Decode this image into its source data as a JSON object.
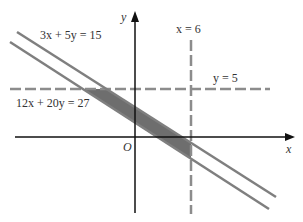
{
  "figure": {
    "colors": {
      "axis": "#111111",
      "line": "#7f7f7f",
      "dashed": "#8c8c8c",
      "shade": "#6e6e6e",
      "text": "#333333",
      "background": "#ffffff"
    },
    "axes": {
      "x_label": "x",
      "y_label": "y",
      "origin_label": "O"
    },
    "lines": [
      {
        "id": "upper",
        "label": "3x + 5y = 15",
        "style": "solid"
      },
      {
        "id": "lower",
        "label": "12x + 20y = 27",
        "style": "solid"
      },
      {
        "id": "vertical",
        "label": "x = 6",
        "style": "dashed"
      },
      {
        "id": "horizontal",
        "label": "y = 5",
        "style": "dashed"
      }
    ],
    "shaded_region": "feasible region between 12x + 20y = 27 and 3x + 5y = 15, bounded by y = 5 and x = 6"
  }
}
